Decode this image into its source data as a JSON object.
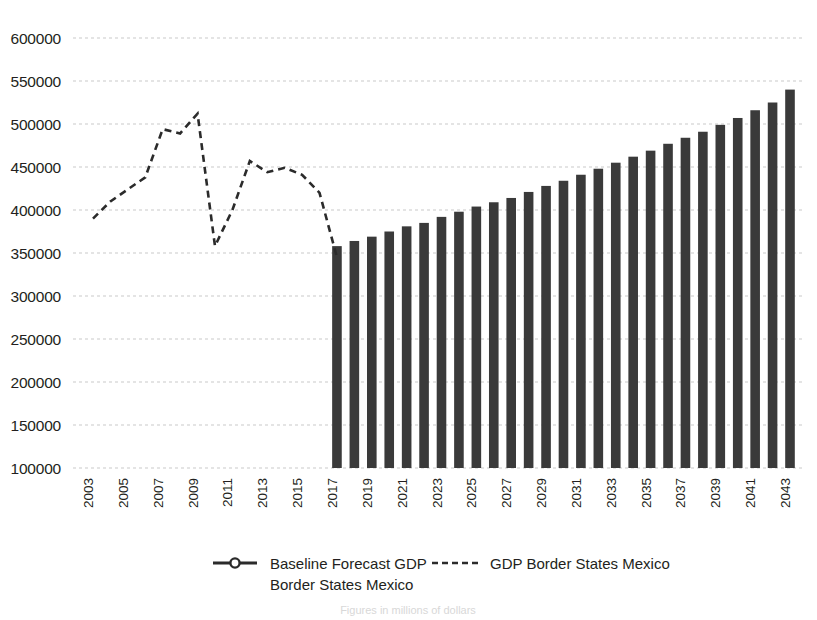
{
  "chart_data": {
    "type": "bar",
    "title": "",
    "subtitle": "",
    "xlabel": "",
    "ylabel": "",
    "ylim": [
      100000,
      600000
    ],
    "ytick_values": [
      100000,
      150000,
      200000,
      250000,
      300000,
      350000,
      400000,
      450000,
      500000,
      550000,
      600000
    ],
    "ytick_labels": [
      "100000",
      "150000",
      "200000",
      "250000",
      "300000",
      "350000",
      "400000",
      "450000",
      "500000",
      "550000",
      "600000"
    ],
    "grid": true,
    "x": [
      2003,
      2004,
      2005,
      2006,
      2007,
      2008,
      2009,
      2010,
      2011,
      2012,
      2013,
      2014,
      2015,
      2016,
      2017,
      2018,
      2019,
      2020,
      2021,
      2022,
      2023,
      2024,
      2025,
      2026,
      2027,
      2028,
      2029,
      2030,
      2031,
      2032,
      2033,
      2034,
      2035,
      2036,
      2037,
      2038,
      2039,
      2040,
      2041,
      2042,
      2043
    ],
    "xtick_labels": [
      "2003",
      "2005",
      "2007",
      "2009",
      "2011",
      "2013",
      "2015",
      "2017",
      "2019",
      "2021",
      "2023",
      "2025",
      "2027",
      "2029",
      "2031",
      "2033",
      "2035",
      "2037",
      "2039",
      "2041",
      "2043"
    ],
    "xtick_step": 2,
    "legend_position": "bottom",
    "series": [
      {
        "name": "GDP Border States Mexico",
        "type": "line",
        "style": "dashed",
        "color": "#2b2b2b",
        "x": [
          2003,
          2004,
          2005,
          2006,
          2007,
          2008,
          2009,
          2010,
          2011,
          2012,
          2013,
          2014,
          2015,
          2016,
          2017
        ],
        "values": [
          390000,
          410000,
          424000,
          438000,
          494000,
          489000,
          512000,
          358000,
          400000,
          457000,
          444000,
          449000,
          441000,
          420000,
          345000
        ]
      },
      {
        "name": "Baseline Forecast GDP Border States Mexico",
        "type": "bar",
        "color": "#3a3a3a",
        "x": [
          2017,
          2018,
          2019,
          2020,
          2021,
          2022,
          2023,
          2024,
          2025,
          2026,
          2027,
          2028,
          2029,
          2030,
          2031,
          2032,
          2033,
          2034,
          2035,
          2036,
          2037,
          2038,
          2039,
          2040,
          2041,
          2042,
          2043
        ],
        "values": [
          358000,
          364000,
          369000,
          375000,
          381000,
          385000,
          392000,
          398000,
          404000,
          409000,
          414000,
          421000,
          428000,
          434000,
          441000,
          448000,
          455000,
          462000,
          469000,
          477000,
          484000,
          491000,
          499000,
          507000,
          516000,
          525000,
          540000
        ]
      }
    ]
  },
  "legend": {
    "entries": [
      {
        "label_line1": "Baseline Forecast GDP",
        "label_line2": "Border States Mexico",
        "marker": "line-with-circle-marker"
      },
      {
        "label_line1": "GDP Border States Mexico",
        "label_line2": "",
        "marker": "dashed-line"
      }
    ]
  },
  "caption": {
    "text": "Figures in millions of dollars"
  },
  "colors": {
    "bar": "#3a3a3a",
    "line": "#2b2b2b",
    "grid": "#c9c9c9",
    "text": "#231f20",
    "background": "#ffffff"
  }
}
